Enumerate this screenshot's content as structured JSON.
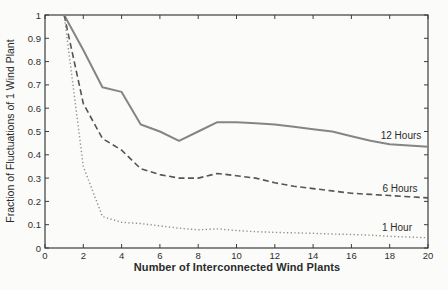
{
  "figure": {
    "background_color": "#fbfbf9",
    "axis_color": "#3c3c3c",
    "text_color": "#2e2e2e"
  },
  "chart_data": {
    "type": "line",
    "title": "",
    "xlabel": "Number of Interconnected Wind Plants",
    "ylabel": "Fraction of Fluctuations of 1 Wind Plant",
    "xlim": [
      0,
      20
    ],
    "ylim": [
      0,
      1
    ],
    "grid": false,
    "legend_position": "inline-right",
    "x_tick_values": [
      0,
      2,
      4,
      6,
      8,
      10,
      12,
      14,
      16,
      18,
      20
    ],
    "x_tick_labels": [
      "0",
      "2",
      "4",
      "6",
      "8",
      "10",
      "12",
      "14",
      "16",
      "18",
      "20"
    ],
    "y_tick_values": [
      0,
      0.1,
      0.2,
      0.3,
      0.4,
      0.5,
      0.6,
      0.7,
      0.8,
      0.9,
      1
    ],
    "y_tick_labels": [
      "0",
      "0.1",
      "0.2",
      "0.3",
      "0.4",
      "0.5",
      "0.6",
      "0.7",
      "0.8",
      "0.9",
      "1"
    ],
    "x": [
      1,
      2,
      3,
      4,
      5,
      6,
      7,
      8,
      9,
      10,
      11,
      12,
      13,
      14,
      15,
      16,
      17,
      18,
      19,
      20
    ],
    "series": [
      {
        "name": "12 Hours",
        "style": "solid",
        "color": "#858585",
        "width": 2,
        "dash": "",
        "values": [
          1.0,
          0.85,
          0.69,
          0.67,
          0.53,
          0.5,
          0.46,
          0.5,
          0.54,
          0.54,
          0.535,
          0.53,
          0.52,
          0.51,
          0.5,
          0.48,
          0.46,
          0.445,
          0.44,
          0.435
        ]
      },
      {
        "name": "6 Hours",
        "style": "dashed",
        "color": "#555555",
        "width": 1.6,
        "dash": "6 3.5",
        "values": [
          1.0,
          0.62,
          0.47,
          0.42,
          0.34,
          0.315,
          0.3,
          0.3,
          0.32,
          0.31,
          0.3,
          0.28,
          0.265,
          0.255,
          0.245,
          0.235,
          0.23,
          0.225,
          0.22,
          0.215
        ]
      },
      {
        "name": "1 Hour",
        "style": "dotted",
        "color": "#8f8f8f",
        "width": 1.4,
        "dash": "1.3 2.4",
        "values": [
          1.0,
          0.35,
          0.135,
          0.11,
          0.105,
          0.095,
          0.085,
          0.078,
          0.082,
          0.075,
          0.07,
          0.067,
          0.065,
          0.063,
          0.06,
          0.058,
          0.055,
          0.05,
          0.047,
          0.044
        ]
      }
    ]
  }
}
